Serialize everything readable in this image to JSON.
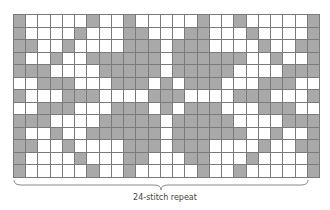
{
  "chart": {
    "columns": 25,
    "rows": 13,
    "colors": {
      "contrast": "#a9a9a9",
      "main": "#ffffff",
      "grid_line": "#7a7a7a"
    },
    "grid": [
      "GWWWWWGWWGWWWWWGWWGWWWWWG",
      "GWWWWGWWWGGWWWGGWWWGWWWWG",
      "GGWWGWWWWGGGWGGGWWWWGWWGG",
      "GWWGWWGGGGGGWGGGGGGWWGWWG",
      "GGGWWWWGGGGGWGGGGGWWWWGGG",
      "WWGGGWWWGGGWGWGGGWWWGGGWW",
      "GWWWGGGWWWWGGGWWWWGGGWWWG",
      "WWGGGWWWGGGWGWGGGWWWGGGWW",
      "GGGWWWWGGGGGWGGGGGWWWWGGG",
      "GWWGWWGGGGGGWGGGGGGWWGWWG",
      "GGWWGWWWWGGGWGGGWWWWGWWGG",
      "GWWWWGWWWGGWWWGGWWWGWWWWG",
      "GWWWWWGWWGWWWWWGWWGWWWWWG"
    ]
  },
  "repeat": {
    "stitches": 24,
    "label": "24-stitch repeat"
  }
}
